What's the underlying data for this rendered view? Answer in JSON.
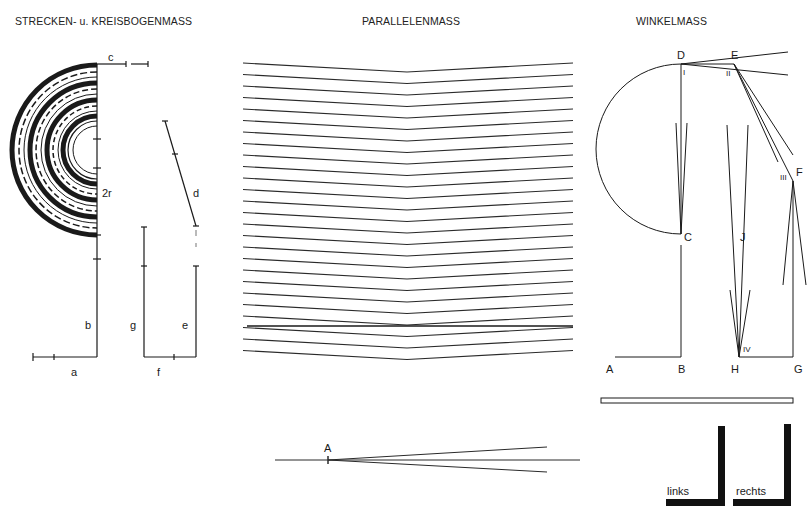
{
  "titles": {
    "left": "STRECKEN- u. KREISBOGENMASS",
    "center": "PARALLELENMASS",
    "right": "WINKELMASS"
  },
  "left_panel": {
    "labels": {
      "c": "c",
      "r2": "2r",
      "d": "d",
      "b": "b",
      "g": "g",
      "e": "e",
      "a": "a",
      "f": "f"
    }
  },
  "center_panel": {
    "line_count": 26,
    "crossed_line_index": 20,
    "bottom_figure_label": "A"
  },
  "right_panel": {
    "points": {
      "D": "D",
      "E": "E",
      "F": "F",
      "C": "C",
      "J": "J",
      "A": "A",
      "B": "B",
      "H": "H",
      "G": "G"
    },
    "roman": {
      "I": "I",
      "II": "II",
      "III": "III",
      "IV": "IV"
    },
    "corner_left_label": "links",
    "corner_right_label": "rechts"
  },
  "colors": {
    "ink": "#1a1a1a",
    "background": "#ffffff"
  }
}
